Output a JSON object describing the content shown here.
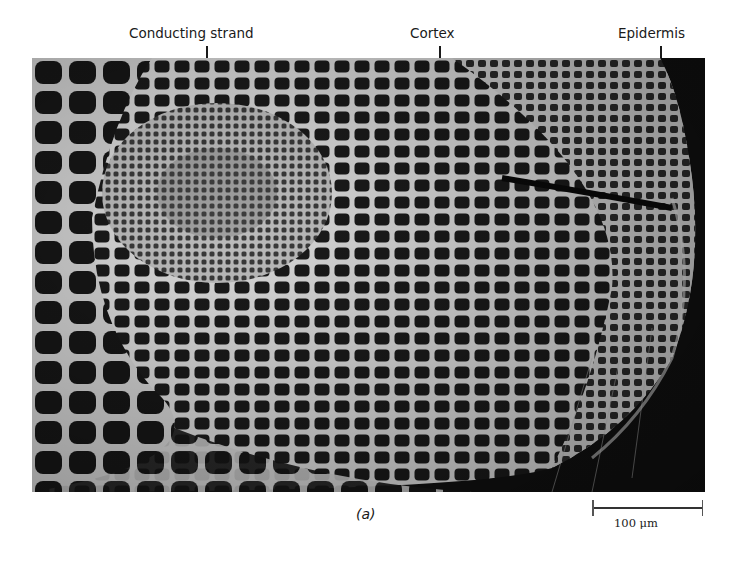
{
  "figure": {
    "labels": [
      {
        "id": "conducting-strand",
        "text": "Conducting strand"
      },
      {
        "id": "cortex",
        "text": "Cortex"
      },
      {
        "id": "epidermis",
        "text": "Epidermis"
      }
    ],
    "panel_caption": "(a)",
    "scale_bar": {
      "value": "100",
      "unit": "μm",
      "text": "100 μm"
    },
    "colors": {
      "background": "#ffffff",
      "micrograph_dark": "#111111",
      "cell_wall": "#d8d8d8",
      "text": "#1a1a1a"
    }
  }
}
